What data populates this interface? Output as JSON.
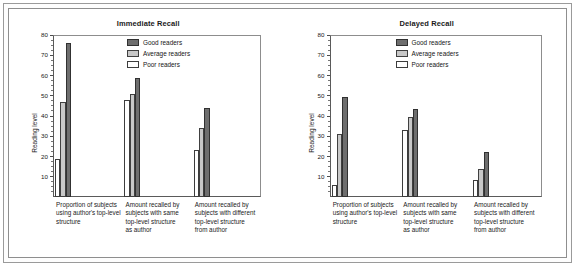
{
  "chart_data": [
    {
      "type": "bar",
      "title": "Immediate Recall",
      "xlabel": "",
      "ylabel": "Reading level",
      "ylim": [
        0,
        80
      ],
      "yticks": [
        10,
        20,
        30,
        40,
        50,
        60,
        70,
        80
      ],
      "grid": false,
      "legend_position": "top-right",
      "categories": [
        "Proportion of subjects using author's top-level structure",
        "Amount recalled by subjects with same top-level structure as author",
        "Amount recalled by subjects with different top-level structure from author"
      ],
      "series": [
        {
          "name": "Poor readers",
          "values": [
            19,
            48,
            23
          ],
          "color": "#ffffff"
        },
        {
          "name": "Average readers",
          "values": [
            47,
            51,
            34
          ],
          "color": "#c8c8c8"
        },
        {
          "name": "Good readers",
          "values": [
            76,
            59,
            44
          ],
          "color": "#6e6e6e"
        }
      ]
    },
    {
      "type": "bar",
      "title": "Delayed Recall",
      "xlabel": "",
      "ylabel": "Reading level",
      "ylim": [
        0,
        80
      ],
      "yticks": [
        10,
        20,
        30,
        40,
        50,
        60,
        70,
        80
      ],
      "grid": false,
      "legend_position": "top-right",
      "categories": [
        "Proportion of subjects using author's top-level structure",
        "Amount recalled by subjects with same top-level structure as author",
        "Amount recalled by subjects with different top-level structure from author"
      ],
      "series": [
        {
          "name": "Poor readers",
          "values": [
            6,
            33,
            8.5
          ],
          "color": "#ffffff"
        },
        {
          "name": "Average readers",
          "values": [
            31,
            39.5,
            14
          ],
          "color": "#c8c8c8"
        },
        {
          "name": "Good readers",
          "values": [
            49.5,
            43.5,
            22
          ],
          "color": "#6e6e6e"
        }
      ]
    }
  ],
  "panels": [
    {
      "title": "Immediate Recall",
      "ylabel": "Reading level",
      "yticks": [
        "80",
        "70",
        "60",
        "50",
        "40",
        "30",
        "20",
        "10"
      ],
      "legend": [
        {
          "label": "Good readers",
          "key": "good"
        },
        {
          "label": "Average readers",
          "key": "average"
        },
        {
          "label": "Poor readers",
          "key": "poor"
        }
      ],
      "xlabels": [
        {
          "line1": "Proportion of subjects",
          "line2": "using author's top-level",
          "line3": "structure",
          "line4": ""
        },
        {
          "line1": "Amount recalled by",
          "line2": "subjects with same",
          "line3": "top-level structure",
          "line4": "as author"
        },
        {
          "line1": "Amount recalled by",
          "line2": "subjects with different",
          "line3": "top-level structure",
          "line4": "from author"
        }
      ]
    },
    {
      "title": "Delayed Recall",
      "ylabel": "Reading level",
      "yticks": [
        "80",
        "70",
        "60",
        "50",
        "40",
        "30",
        "20",
        "10"
      ],
      "legend": [
        {
          "label": "Good readers",
          "key": "good"
        },
        {
          "label": "Average readers",
          "key": "average"
        },
        {
          "label": "Poor readers",
          "key": "poor"
        }
      ],
      "xlabels": [
        {
          "line1": "Proportion of subjects",
          "line2": "using author's top-level",
          "line3": "structure",
          "line4": ""
        },
        {
          "line1": "Amount recalled by",
          "line2": "subjects with same",
          "line3": "top-level structure",
          "line4": "as author"
        },
        {
          "line1": "Amount recalled by",
          "line2": "subjects with different",
          "line3": "top-level structure",
          "line4": "from author"
        }
      ]
    }
  ],
  "colors": {
    "good": "#6e6e6e",
    "average": "#c8c8c8",
    "poor": "#ffffff",
    "axis": "#4d4d4d",
    "frame": "#8e8e8e"
  }
}
